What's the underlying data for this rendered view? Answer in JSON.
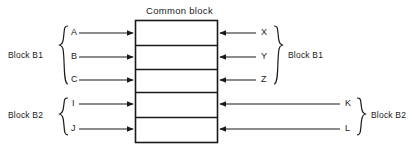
{
  "diagram": {
    "title": "Common block",
    "common_block": {
      "rows": 5,
      "row_labels": [
        "",
        "",
        "",
        "",
        ""
      ]
    },
    "left_groups": [
      {
        "name": "block-b1-left",
        "label": "Block B1",
        "members": [
          "A",
          "B",
          "C"
        ]
      },
      {
        "name": "block-b2-left",
        "label": "Block B2",
        "members": [
          "I",
          "J"
        ]
      }
    ],
    "right_groups": [
      {
        "name": "block-b1-right",
        "label": "Block B1",
        "members": [
          "X",
          "Y",
          "Z"
        ]
      },
      {
        "name": "block-b2-right",
        "label": "Block B2",
        "members": [
          "K",
          "L"
        ]
      }
    ],
    "colors": {
      "stroke": "#1a1a1a",
      "background": "#ffffff",
      "text": "#1a1a1a"
    }
  }
}
